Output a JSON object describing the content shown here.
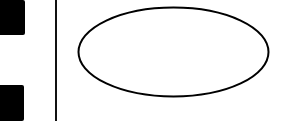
{
  "diagram": {
    "shapes": [
      {
        "id": "left-block-top",
        "type": "rectangle",
        "fill": "#000000",
        "x": 0,
        "y": 0,
        "w": 25,
        "h": 35
      },
      {
        "id": "left-block-bottom",
        "type": "rectangle",
        "fill": "#000000",
        "x": 0,
        "y": 85,
        "w": 24,
        "h": 36
      },
      {
        "id": "divider-line",
        "type": "line",
        "stroke": "#111111",
        "x": 55,
        "y1": 0,
        "y2": 121
      },
      {
        "id": "ellipse",
        "type": "ellipse",
        "stroke": "#000000",
        "fill": "#ffffff",
        "cx": 173,
        "cy": 52,
        "rx": 95,
        "ry": 44,
        "label": ""
      }
    ],
    "ellipse_label": ""
  },
  "colors": {
    "background": "#ffffff",
    "stroke": "#000000"
  }
}
